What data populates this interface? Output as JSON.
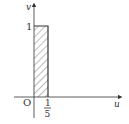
{
  "diagram": {
    "type": "uniform-density-plot",
    "axes": {
      "vertical_label": "v",
      "horizontal_label": "u",
      "origin_label": "O"
    },
    "y_tick": {
      "label": "1",
      "value": 1
    },
    "x_tick": {
      "numerator": "1",
      "denominator": "5",
      "value": 0.2
    },
    "region": {
      "description": "hatched rectangle",
      "u_range": [
        0,
        0.2
      ],
      "v_range": [
        0,
        1
      ]
    },
    "colors": {
      "line": "#333333",
      "hatch": "#555555",
      "background": "#ffffff"
    }
  }
}
